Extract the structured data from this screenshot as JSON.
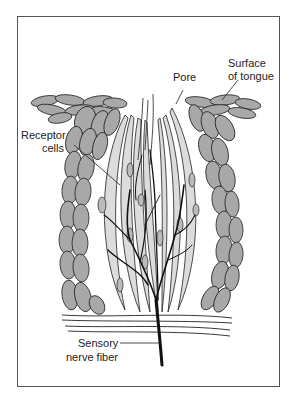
{
  "diagram": {
    "labels": {
      "pore": "Pore",
      "surface_line1": "Surface",
      "surface_line2": "of tongue",
      "receptor_line1": "Receptor",
      "receptor_line2": "cells",
      "nerve_line1": "Sensory",
      "nerve_line2": "nerve fiber"
    },
    "colors": {
      "epithelium_fill": "#a8a8a8",
      "receptor_fill": "#dcdcdc",
      "outline": "#222222",
      "nerve": "#111111",
      "frame": "#555555"
    }
  }
}
